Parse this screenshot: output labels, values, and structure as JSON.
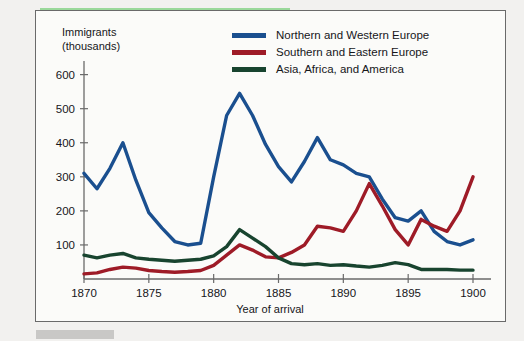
{
  "chart_data": {
    "type": "line",
    "title": "",
    "ylabel": "Immigrants (thousands)",
    "ylabel_line1": "Immigrants",
    "ylabel_line2": "(thousands)",
    "xlabel": "Year of arrival",
    "xlim": [
      1870,
      1900
    ],
    "ylim": [
      0,
      640
    ],
    "yticks": [
      100,
      200,
      300,
      400,
      500,
      600
    ],
    "ytick_labels": [
      "100",
      "200",
      "300",
      "400",
      "500",
      "600"
    ],
    "xticks": [
      1870,
      1875,
      1880,
      1885,
      1890,
      1895,
      1900
    ],
    "xtick_labels": [
      "1870",
      "1875",
      "1880",
      "1885",
      "1890",
      "1895",
      "1900"
    ],
    "grid": false,
    "legend_position": "top-right",
    "x": [
      1870,
      1871,
      1872,
      1873,
      1874,
      1875,
      1876,
      1877,
      1878,
      1879,
      1880,
      1881,
      1882,
      1883,
      1884,
      1885,
      1886,
      1887,
      1888,
      1889,
      1890,
      1891,
      1892,
      1893,
      1894,
      1895,
      1896,
      1897,
      1898,
      1899,
      1900
    ],
    "series": [
      {
        "name": "Northern and Western Europe",
        "color": "#1a4f8f",
        "values": [
          310,
          265,
          325,
          400,
          290,
          195,
          150,
          110,
          100,
          105,
          300,
          480,
          545,
          480,
          395,
          330,
          285,
          345,
          415,
          350,
          335,
          310,
          300,
          235,
          180,
          170,
          200,
          140,
          110,
          100,
          115
        ]
      },
      {
        "name": "Southern and Eastern Europe",
        "color": "#9e1b27",
        "values": [
          15,
          18,
          28,
          35,
          32,
          25,
          22,
          20,
          22,
          25,
          40,
          70,
          100,
          85,
          65,
          62,
          78,
          100,
          155,
          150,
          140,
          200,
          280,
          215,
          145,
          100,
          175,
          155,
          140,
          200,
          300
        ]
      },
      {
        "name": "Asia, Africa, and America",
        "color": "#18442f",
        "values": [
          70,
          62,
          70,
          75,
          62,
          58,
          55,
          52,
          55,
          58,
          68,
          95,
          145,
          120,
          95,
          62,
          45,
          42,
          45,
          40,
          42,
          38,
          35,
          40,
          48,
          42,
          28,
          28,
          28,
          26,
          26
        ]
      }
    ]
  },
  "legend": {
    "items": [
      {
        "label": "Northern and Western Europe",
        "color": "#1a4f8f"
      },
      {
        "label": "Southern and Eastern Europe",
        "color": "#9e1b27"
      },
      {
        "label": "Asia, Africa, and America",
        "color": "#18442f"
      }
    ]
  }
}
